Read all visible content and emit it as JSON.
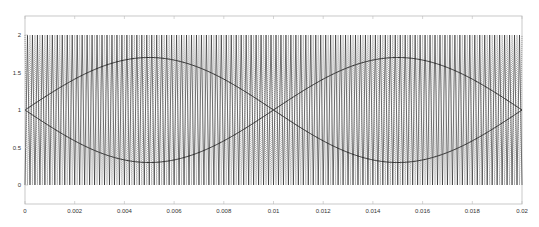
{
  "chart_data": {
    "type": "line",
    "title": "",
    "xlabel": "",
    "ylabel": "",
    "xlim": [
      0,
      0.02
    ],
    "ylim": [
      -0.25,
      2.25
    ],
    "grid": false,
    "legend": null,
    "x_ticks": [
      0,
      0.002,
      0.004,
      0.006,
      0.008,
      0.01,
      0.012,
      0.014,
      0.016,
      0.018,
      0.02
    ],
    "x_tick_labels": [
      "0",
      "0.002",
      "0.004",
      "0.006",
      "0.008",
      "0.01",
      "0.012",
      "0.014",
      "0.016",
      "0.018",
      "0.02"
    ],
    "y_ticks": [
      0,
      0.5,
      1,
      1.5,
      2
    ],
    "y_tick_labels": [
      "0",
      "0.5",
      "1",
      "1.5",
      "2"
    ],
    "series": [
      {
        "name": "carrier-1",
        "kind": "triangle",
        "frequency_hz": 5000,
        "min": 0,
        "max": 2,
        "phase": 0,
        "style": "solid",
        "color": "#222222"
      },
      {
        "name": "carrier-2",
        "kind": "triangle",
        "frequency_hz": 5000,
        "min": 0,
        "max": 2,
        "phase": 0.5,
        "style": "dotted",
        "color": "#555555"
      },
      {
        "name": "reference-a",
        "kind": "sine",
        "frequency_hz": 50,
        "offset": 1,
        "amplitude": 0.7,
        "phase_deg": 0,
        "style": "solid",
        "color": "#222222",
        "key_points": {
          "x": [
            0,
            0.005,
            0.01,
            0.015,
            0.02
          ],
          "y": [
            1,
            1.7,
            1,
            0.3,
            1
          ]
        }
      },
      {
        "name": "reference-b",
        "kind": "sine",
        "frequency_hz": 50,
        "offset": 1,
        "amplitude": 0.7,
        "phase_deg": 180,
        "style": "solid",
        "color": "#222222",
        "key_points": {
          "x": [
            0,
            0.005,
            0.01,
            0.015,
            0.02
          ],
          "y": [
            1,
            0.3,
            1,
            1.7,
            1
          ]
        }
      }
    ]
  },
  "layout": {
    "plot_left": 25,
    "plot_right": 522,
    "plot_top": 16,
    "plot_bottom": 204,
    "y_at_2": 35,
    "y_at_0": 185,
    "axis_color": "#bbbbbb"
  }
}
